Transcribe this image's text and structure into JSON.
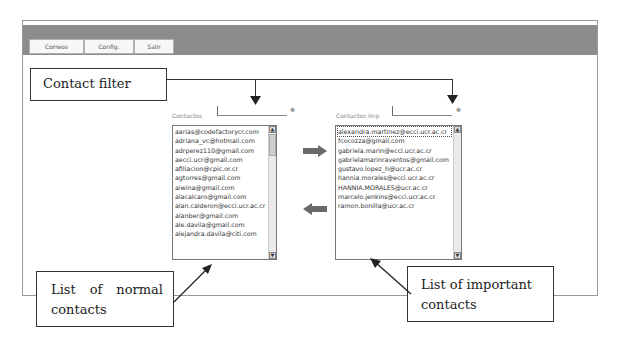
{
  "menu": {
    "tabs": [
      {
        "label": "Correos"
      },
      {
        "label": "Config."
      },
      {
        "label": "Salir"
      }
    ]
  },
  "annotations": {
    "contact_filter": "Contact filter",
    "normal_list": "List of normal contacts",
    "important_list": "List of important contacts"
  },
  "normal_contacts": {
    "label": "Contactos",
    "filter_value": "",
    "items": [
      "aarias@codefactorycr.com",
      "adriana_vc@hotmail.com",
      "adrperez110@gmail.com",
      "aecci.ucr@gmail.com",
      "afiliacion@cpic.or.cr",
      "agtorres@gmail.com",
      "aiwina@gmail.com",
      "alacalcaro@gmail.com",
      "alan.calderon@ecci.ucr.ac.cr",
      "alanber@gmail.com",
      "ale.davila@gmail.com",
      "alejandra.davila@citi.com"
    ]
  },
  "important_contacts": {
    "label": "Contactos Imp",
    "filter_value": "",
    "items": [
      "alexandra.martinez@ecci.ucr.ac.cr",
      "fcocozza@gmail.com",
      "gabriela.marin@ecci.ucr.ac.cr",
      "gabrielamarinraventos@gmail.com",
      "gustavo.lopez_h@ucr.ac.cr",
      "hannia.morales@ecci.ucr.ac.cr",
      "HANNIA.MORALES@ucr.ac.cr",
      "marcelo.jenkins@ecci.ucr.ac.cr",
      "ramon.bonilla@ucr.ac.cr"
    ]
  },
  "controls": {
    "move_right_icon": "arrow-right-icon",
    "move_left_icon": "arrow-left-icon",
    "filter_icon": "asterisk-icon"
  },
  "colors": {
    "topbar": "#8c8c8c",
    "arrow": "#6a6a6a"
  }
}
